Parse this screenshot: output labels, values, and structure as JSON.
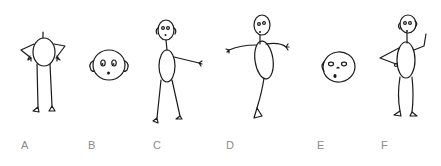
{
  "figure": {
    "panels": [
      {
        "label": "A",
        "pose": "figure seen from behind/top, arms bent with hands on hips, round head as body"
      },
      {
        "label": "B",
        "pose": "head only, frontal, surprised face with ears"
      },
      {
        "label": "C",
        "pose": "standing figure, one arm extended to the right"
      },
      {
        "label": "D",
        "pose": "figure with both arms out, balancing on one leg"
      },
      {
        "label": "E",
        "pose": "head only, three-quarter view, surprised face"
      },
      {
        "label": "F",
        "pose": "standing figure, one hand raised, other hand on hip"
      }
    ]
  },
  "colors": {
    "stroke": "#1a1a1a",
    "label": "#8a8a8a",
    "background": "#ffffff"
  }
}
